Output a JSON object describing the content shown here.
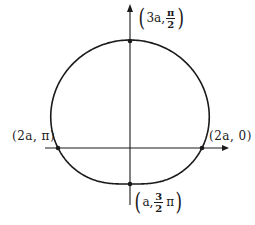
{
  "diagram": {
    "type": "polar-curve",
    "curve": "limacon r = a(2 + sin θ)",
    "colors": {
      "ink": "#1a1a1a",
      "background": "#ffffff"
    },
    "points": {
      "top": {
        "label_prefix": "3a,",
        "frac_num": "π",
        "frac_den": "2",
        "label_suffix": ""
      },
      "left": {
        "label": "(2a, π)"
      },
      "right": {
        "label": "(2a, 0)"
      },
      "bottom": {
        "label_prefix": "a,",
        "frac_num": "3",
        "frac_den": "2",
        "label_suffix": "π"
      }
    },
    "paren_open": "(",
    "paren_close": ")"
  }
}
